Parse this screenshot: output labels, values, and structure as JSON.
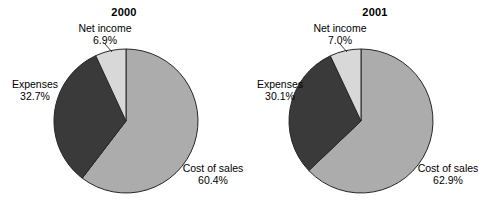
{
  "figure": {
    "background": "#ffffff",
    "width": 497,
    "height": 210
  },
  "palette": {
    "cost_of_sales": "#ACACAC",
    "expenses": "#3A3A3A",
    "net_income": "#D8D8D8",
    "outline": "#262626",
    "text": "#000000"
  },
  "charts": [
    {
      "title": "2000",
      "labels": {
        "net_income_name": "Net income",
        "net_income_value": "6.9%",
        "expenses_name": "Expenses",
        "expenses_value": "32.7%",
        "cost_name": "Cost of sales",
        "cost_value": "60.4%"
      }
    },
    {
      "title": "2001",
      "labels": {
        "net_income_name": "Net income",
        "net_income_value": "7.0%",
        "expenses_name": "Expenses",
        "expenses_value": "30.1%",
        "cost_name": "Cost of sales",
        "cost_value": "62.9%"
      }
    }
  ],
  "chart_data": [
    {
      "type": "pie",
      "title": "2000",
      "labels": [
        "Cost of sales",
        "Expenses",
        "Net income"
      ],
      "values": [
        60.4,
        32.7,
        6.9
      ],
      "value_suffix": "%",
      "colors": [
        "#ACACAC",
        "#3A3A3A",
        "#D8D8D8"
      ],
      "start_angle_deg": 0,
      "direction": "clockwise",
      "center": [
        126,
        121
      ],
      "radius": 72,
      "legend": "none",
      "labels_placement": "outside-callout",
      "grid": false
    },
    {
      "type": "pie",
      "title": "2001",
      "labels": [
        "Cost of sales",
        "Expenses",
        "Net income"
      ],
      "values": [
        62.9,
        30.1,
        7.0
      ],
      "value_suffix": "%",
      "colors": [
        "#ACACAC",
        "#3A3A3A",
        "#D8D8D8"
      ],
      "start_angle_deg": 0,
      "direction": "clockwise",
      "center": [
        361,
        121
      ],
      "radius": 72,
      "legend": "none",
      "labels_placement": "outside-callout",
      "grid": false
    }
  ]
}
